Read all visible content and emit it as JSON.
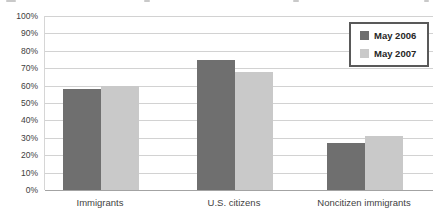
{
  "chart_data": {
    "type": "bar",
    "title": "",
    "categories": [
      "Immigrants",
      "U.S. citizens",
      "Noncitizen immigrants"
    ],
    "series": [
      {
        "name": "May 2006",
        "color": "#6f6f6f",
        "values": [
          58,
          75,
          27
        ]
      },
      {
        "name": "May 2007",
        "color": "#c9c9c9",
        "values": [
          60,
          68,
          31
        ]
      }
    ],
    "ylim": [
      0,
      100
    ],
    "ytick_step": 10,
    "yticks": [
      "100%",
      "90%",
      "80%",
      "70%",
      "60%",
      "50%",
      "40%",
      "30%",
      "20%",
      "10%",
      "0%"
    ],
    "xlabel": "",
    "ylabel": "",
    "grid": true,
    "legend_position": "top-right"
  },
  "colors": {
    "gridline": "#d2d2d2",
    "axis_line": "#a3a3a3",
    "tick_text": "#404040",
    "legend_border": "#595959"
  }
}
